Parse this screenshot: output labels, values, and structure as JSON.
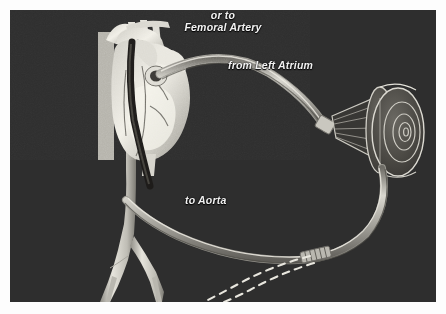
{
  "figure": {
    "kind": "medical-illustration",
    "background_color": "#2e2e2e",
    "border_color": "#ffffff",
    "label_color": "#f2f2f2",
    "vessel_color": "#d8d6cf",
    "cannula_color": "#bdbbb4"
  },
  "labels": {
    "left_atrium": "from Left Atrium",
    "aorta": "to Aorta",
    "femoral_line1": "or to",
    "femoral_line2": "Femoral Artery"
  },
  "parts": {
    "heart": "heart-anatomy",
    "aortic_arch": "aortic-arch",
    "descending_aorta": "descending-aorta",
    "iliac_branches": "iliac-bifurcation",
    "inflow_cannula": "inflow-cannula",
    "outflow_cannula": "outflow-cannula",
    "pump": "blood-pump-device",
    "pump_cone": "pump-inlet-cone",
    "connector_top": "tube-connector",
    "connector_bottom": "ribbed-tube-connector",
    "dashed_route": "alternate-femoral-route"
  }
}
